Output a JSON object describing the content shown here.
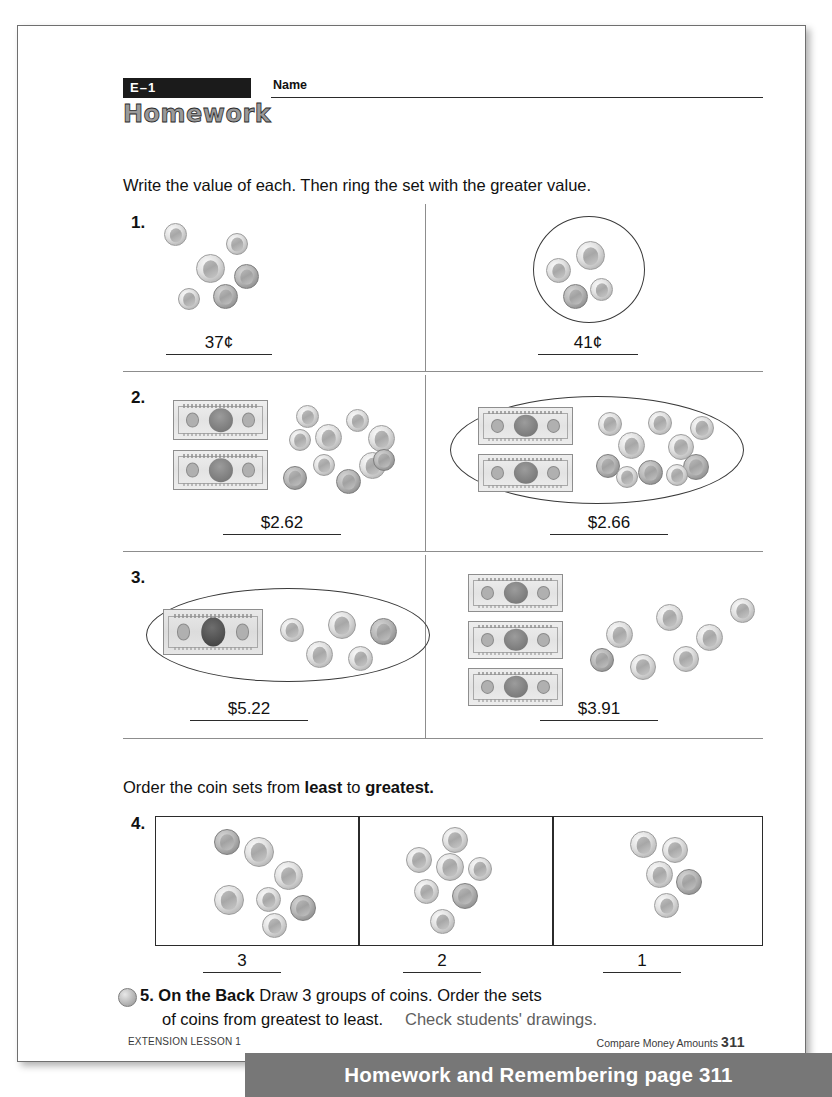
{
  "worksheet": {
    "lesson_tag": "E–1",
    "title": "Homework",
    "name_label": "Name",
    "direction_1": "Write the value of each. Then ring the set with the greater value.",
    "direction_2_pre": "Order the coin sets from ",
    "direction_2_bold1": "least",
    "direction_2_mid": " to ",
    "direction_2_bold2": "greatest.",
    "problems": [
      {
        "number": "1.",
        "left": {
          "answer": "37¢",
          "ringed": false
        },
        "right": {
          "answer": "41¢",
          "ringed": true
        }
      },
      {
        "number": "2.",
        "left": {
          "answer": "$2.62",
          "ringed": false
        },
        "right": {
          "answer": "$2.66",
          "ringed": true
        }
      },
      {
        "number": "3.",
        "left": {
          "answer": "$5.22",
          "ringed": true
        },
        "right": {
          "answer": "$3.91",
          "ringed": false
        }
      }
    ],
    "ordering": {
      "number": "4.",
      "answers": [
        "3",
        "2",
        "1"
      ]
    },
    "item5": {
      "number": "5.",
      "bold_label": "On the Back",
      "text_line1": "Draw 3 groups of coins. Order the sets",
      "text_line2": "of coins from greatest to least.",
      "answer_note": "Check students' drawings."
    },
    "footer": {
      "left": "EXTENSION LESSON 1",
      "right_label": "Compare Money Amounts",
      "right_page": "311"
    }
  },
  "banner": {
    "text": "Homework and Remembering page 311",
    "bg_color": "#777777",
    "text_color": "#ffffff"
  }
}
